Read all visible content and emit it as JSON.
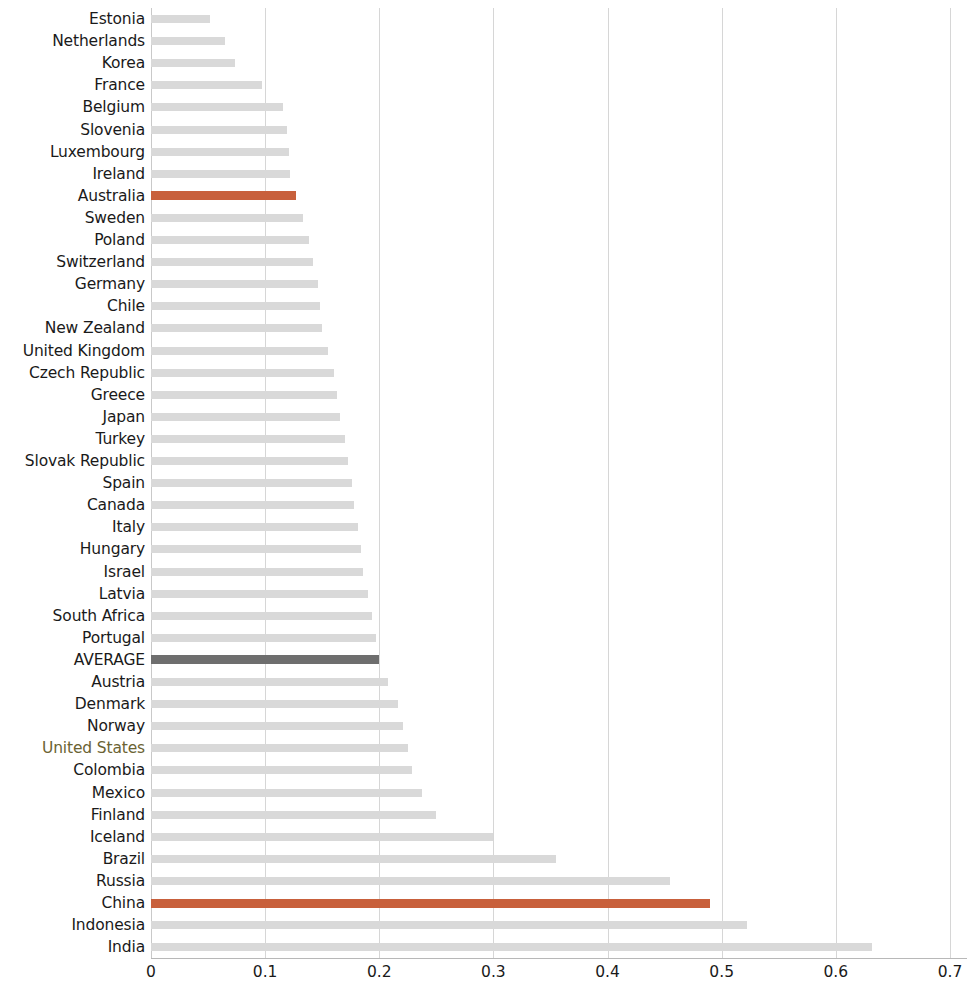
{
  "chart_data": {
    "type": "bar",
    "orientation": "horizontal",
    "title": "",
    "subtitle": "",
    "xlabel": "",
    "ylabel": "",
    "xlim": [
      0,
      0.7
    ],
    "xticks": [
      0,
      0.1,
      0.2,
      0.3,
      0.4,
      0.5,
      0.6,
      0.7
    ],
    "xtick_labels": [
      "0",
      "0.1",
      "0.2",
      "0.3",
      "0.4",
      "0.5",
      "0.6",
      "0.7"
    ],
    "grid": "vertical",
    "legend": "none",
    "colors": {
      "bar_default": "#d9d9d9",
      "bar_highlight": "#c8603c",
      "bar_average": "#6e6e6e",
      "gridline": "#d6d6d6",
      "axis": "#b8b8b8",
      "label": "#1a1a1a",
      "label_us_tint": "#6b6333"
    },
    "categories": [
      "Estonia",
      "Netherlands",
      "Korea",
      "France",
      "Belgium",
      "Slovenia",
      "Luxembourg",
      "Ireland",
      "Australia",
      "Sweden",
      "Poland",
      "Switzerland",
      "Germany",
      "Chile",
      "New Zealand",
      "United Kingdom",
      "Czech Republic",
      "Greece",
      "Japan",
      "Turkey",
      "Slovak Republic",
      "Spain",
      "Canada",
      "Italy",
      "Hungary",
      "Israel",
      "Latvia",
      "South Africa",
      "Portugal",
      "AVERAGE",
      "Austria",
      "Denmark",
      "Norway",
      "United States",
      "Colombia",
      "Mexico",
      "Finland",
      "Iceland",
      "Brazil",
      "Russia",
      "China",
      "Indonesia",
      "India"
    ],
    "values": [
      0.052,
      0.065,
      0.074,
      0.097,
      0.116,
      0.119,
      0.121,
      0.122,
      0.127,
      0.133,
      0.138,
      0.142,
      0.146,
      0.148,
      0.15,
      0.155,
      0.16,
      0.163,
      0.166,
      0.17,
      0.173,
      0.176,
      0.178,
      0.181,
      0.184,
      0.186,
      0.19,
      0.194,
      0.197,
      0.2,
      0.208,
      0.216,
      0.221,
      0.225,
      0.229,
      0.237,
      0.25,
      0.3,
      0.355,
      0.455,
      0.49,
      0.522,
      0.632
    ],
    "styles": [
      "default",
      "default",
      "default",
      "default",
      "default",
      "default",
      "default",
      "default",
      "highlight",
      "default",
      "default",
      "default",
      "default",
      "default",
      "default",
      "default",
      "default",
      "default",
      "default",
      "default",
      "default",
      "default",
      "default",
      "default",
      "default",
      "default",
      "default",
      "default",
      "default",
      "average",
      "default",
      "default",
      "default",
      "default",
      "default",
      "default",
      "default",
      "default",
      "default",
      "default",
      "highlight",
      "default",
      "default"
    ],
    "label_styles": [
      "normal",
      "normal",
      "normal",
      "normal",
      "normal",
      "normal",
      "normal",
      "normal",
      "normal",
      "normal",
      "normal",
      "normal",
      "normal",
      "normal",
      "normal",
      "normal",
      "normal",
      "normal",
      "normal",
      "normal",
      "normal",
      "normal",
      "normal",
      "normal",
      "normal",
      "normal",
      "normal",
      "normal",
      "normal",
      "normal",
      "normal",
      "normal",
      "normal",
      "us-tint",
      "normal",
      "normal",
      "normal",
      "normal",
      "normal",
      "normal",
      "normal",
      "normal",
      "normal"
    ]
  }
}
